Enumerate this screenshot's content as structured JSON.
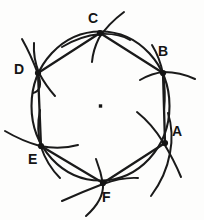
{
  "figure": {
    "ink_color": "#1a1a1a",
    "background_color": "#fdfdfc",
    "center_label": "",
    "center_point": {
      "x": 100.5,
      "y": 106.0
    },
    "circle": {
      "cx": 100.5,
      "cy": 106.0,
      "r": 69.0
    },
    "vertices": [
      {
        "label": "A",
        "x": 165.0,
        "y": 143.0,
        "label_x": 172,
        "label_y": 130
      },
      {
        "label": "B",
        "x": 163.0,
        "y": 73.0,
        "label_x": 163,
        "label_y": 50
      },
      {
        "label": "C",
        "x": 100.0,
        "y": 33.0,
        "label_x": 92,
        "label_y": 13
      },
      {
        "label": "D",
        "x": 38.0,
        "y": 73.0,
        "label_x": 17,
        "label_y": 64
      },
      {
        "label": "E",
        "x": 41.0,
        "y": 146.0,
        "label_x": 31,
        "label_y": 152
      },
      {
        "label": "F",
        "x": 103.0,
        "y": 183.0,
        "label_x": 105,
        "label_y": 190
      }
    ],
    "chords": [
      {
        "from": "A",
        "to": "B"
      },
      {
        "from": "B",
        "to": "C"
      },
      {
        "from": "C",
        "to": "D"
      },
      {
        "from": "D",
        "to": "E"
      },
      {
        "from": "E",
        "to": "F"
      },
      {
        "from": "F",
        "to": "A"
      }
    ],
    "construction_arcs": [
      {
        "at": "C",
        "d": "M 124 12 Q 108 24 99 38 Q 93 50 92 62"
      },
      {
        "at": "B",
        "d": "M 140 80 Q 152 73 164 72 Q 180 72 195 79"
      },
      {
        "at": "A",
        "d": "M 137 112 Q 152 124 163 142 Q 174 160 181 177"
      },
      {
        "at": "F",
        "d": "M 96 159 Q 101 172 103 184 Q 104 200 86 216"
      },
      {
        "at": "E",
        "d": "M 5 131 Q 22 141 40 146 Q 60 150 78 145"
      },
      {
        "at": "D",
        "d": "M 22 39 Q 31 55 38 74 Q 44 90 33 93"
      },
      {
        "at": "A2",
        "d": "M 151 196 Q 166 176 170 153 Q 174 132 168 113"
      },
      {
        "at": "E2",
        "d": "M 40 110 Q 36 130 41 147 Q 47 165 60 178"
      },
      {
        "at": "F2",
        "d": "M 62 201 Q 82 192 103 184 Q 122 177 138 178"
      },
      {
        "at": "C2",
        "d": "M 60 35 Q 80 32 100 34 Q 120 36 133 44"
      },
      {
        "at": "B2",
        "d": "M 152 45 Q 160 58 163 74 Q 166 92 164 110"
      },
      {
        "at": "D2",
        "d": "M 55 96 Q 46 86 39 73 Q 32 58 33 42"
      }
    ],
    "labels_present": [
      "A",
      "B",
      "C",
      "D",
      "E",
      "F"
    ]
  }
}
